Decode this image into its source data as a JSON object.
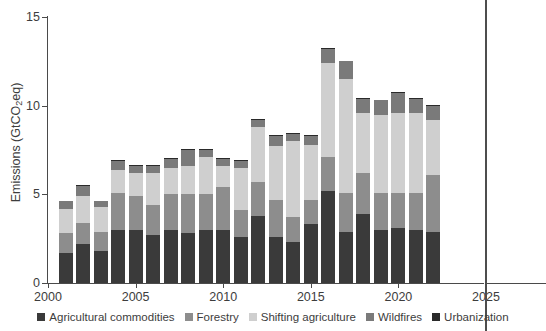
{
  "chart_data": {
    "type": "bar",
    "stacked": true,
    "title": "",
    "xlabel": "",
    "ylabel": "Emissions (GtCO2eq)",
    "ylabel_display": "Emissions (GtCO₂eq)",
    "xlim": [
      2000,
      2025
    ],
    "ylim": [
      0,
      15
    ],
    "yticks": [
      0,
      5,
      10,
      15
    ],
    "xticks": [
      2000,
      2005,
      2010,
      2015,
      2020,
      2025
    ],
    "ytick_labels": [
      "0",
      "5",
      "10",
      "15"
    ],
    "xtick_labels": [
      "2000",
      "2005",
      "2010",
      "2015",
      "2020",
      "2025"
    ],
    "grid": false,
    "legend_position": "bottom",
    "categories": [
      2001,
      2002,
      2003,
      2004,
      2005,
      2006,
      2007,
      2008,
      2009,
      2010,
      2011,
      2012,
      2013,
      2014,
      2015,
      2016,
      2017,
      2018,
      2019,
      2020,
      2021,
      2022
    ],
    "series": [
      {
        "name": "Agricultural commodities",
        "color": "#3a3a3a",
        "values": [
          1.7,
          2.2,
          1.8,
          3.0,
          3.0,
          2.7,
          3.0,
          2.8,
          3.0,
          3.0,
          2.6,
          3.8,
          2.6,
          2.3,
          3.3,
          5.2,
          2.9,
          3.9,
          3.0,
          3.1,
          3.0,
          2.9
        ]
      },
      {
        "name": "Forestry",
        "color": "#8d8d8d",
        "values": [
          1.1,
          1.2,
          1.1,
          2.1,
          1.9,
          1.7,
          2.0,
          2.2,
          2.0,
          2.4,
          1.5,
          1.9,
          2.1,
          1.4,
          1.4,
          1.9,
          2.2,
          2.3,
          2.1,
          2.0,
          2.1,
          3.2
        ]
      },
      {
        "name": "Shifting agriculture",
        "color": "#cfcfcf",
        "values": [
          1.4,
          1.5,
          1.4,
          1.3,
          1.3,
          1.8,
          1.5,
          1.6,
          2.1,
          1.2,
          2.4,
          3.1,
          3.0,
          4.3,
          3.1,
          5.3,
          6.4,
          3.4,
          4.4,
          4.5,
          4.5,
          3.1
        ]
      },
      {
        "name": "Wildfires",
        "color": "#7a7a7a",
        "values": [
          0.4,
          0.6,
          0.3,
          0.5,
          0.4,
          0.4,
          0.5,
          0.9,
          0.4,
          0.4,
          0.4,
          0.4,
          0.6,
          0.4,
          0.5,
          0.8,
          1.0,
          0.8,
          0.8,
          1.1,
          0.8,
          0.8
        ]
      },
      {
        "name": "Urbanization",
        "color": "#2a2a2a",
        "values": [
          0.05,
          0.05,
          0.05,
          0.05,
          0.05,
          0.05,
          0.05,
          0.05,
          0.05,
          0.05,
          0.05,
          0.05,
          0.05,
          0.05,
          0.05,
          0.05,
          0.05,
          0.05,
          0.05,
          0.05,
          0.05,
          0.05
        ]
      }
    ],
    "totals": [
      4.65,
      5.55,
      4.65,
      6.95,
      6.65,
      6.65,
      7.05,
      7.55,
      7.55,
      7.05,
      6.95,
      9.25,
      8.35,
      8.45,
      8.35,
      13.25,
      12.55,
      10.45,
      10.35,
      10.75,
      10.45,
      10.05
    ]
  },
  "legend": {
    "items": [
      {
        "label": "Agricultural commodities",
        "color": "#3a3a3a"
      },
      {
        "label": "Forestry",
        "color": "#8d8d8d"
      },
      {
        "label": "Shifting agriculture",
        "color": "#cfcfcf"
      },
      {
        "label": "Wildfires",
        "color": "#7a7a7a"
      },
      {
        "label": "Urbanization",
        "color": "#2a2a2a"
      }
    ]
  },
  "axis": {
    "y_title": "Emissions (GtCO₂eq)"
  }
}
